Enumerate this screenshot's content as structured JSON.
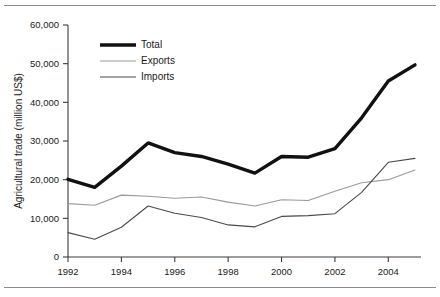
{
  "chart_data": {
    "type": "line",
    "title": "",
    "xlabel": "",
    "ylabel": "Agricultural trade (million US$)",
    "x": [
      1992,
      1993,
      1994,
      1995,
      1996,
      1997,
      1998,
      1999,
      2000,
      2001,
      2002,
      2003,
      2004,
      2005
    ],
    "xtick_labels": [
      "1992",
      "1994",
      "1996",
      "1998",
      "2000",
      "2002",
      "2004"
    ],
    "xtick_values": [
      1992,
      1994,
      1996,
      1998,
      2000,
      2002,
      2004
    ],
    "xlim": [
      1992,
      2005
    ],
    "ytick_labels": [
      "0",
      "10,000",
      "20,000",
      "30,000",
      "40,000",
      "50,000",
      "60,000"
    ],
    "ytick_values": [
      0,
      10000,
      20000,
      30000,
      40000,
      50000,
      60000
    ],
    "ylim": [
      0,
      60000
    ],
    "grid": false,
    "legend_position": "top-left inside plot",
    "series": [
      {
        "name": "Total",
        "color": "#111111",
        "width": 3.4,
        "values": [
          20100,
          18000,
          23500,
          29500,
          27000,
          26000,
          24000,
          21700,
          26000,
          25800,
          28000,
          36000,
          45500,
          49700
        ]
      },
      {
        "name": "Exports",
        "color": "#9a9a9a",
        "width": 1.1,
        "values": [
          13800,
          13400,
          16000,
          15700,
          15200,
          15500,
          14200,
          13200,
          14800,
          14600,
          17000,
          19200,
          20000,
          22500
        ]
      },
      {
        "name": "Imports",
        "color": "#4a4a4a",
        "width": 1.1,
        "values": [
          6300,
          4600,
          7700,
          13200,
          11300,
          10200,
          8300,
          7800,
          10500,
          10700,
          11200,
          16700,
          24500,
          25500
        ]
      }
    ]
  },
  "legend": {
    "entries": [
      {
        "label": "Total"
      },
      {
        "label": "Exports"
      },
      {
        "label": "Imports"
      }
    ]
  }
}
